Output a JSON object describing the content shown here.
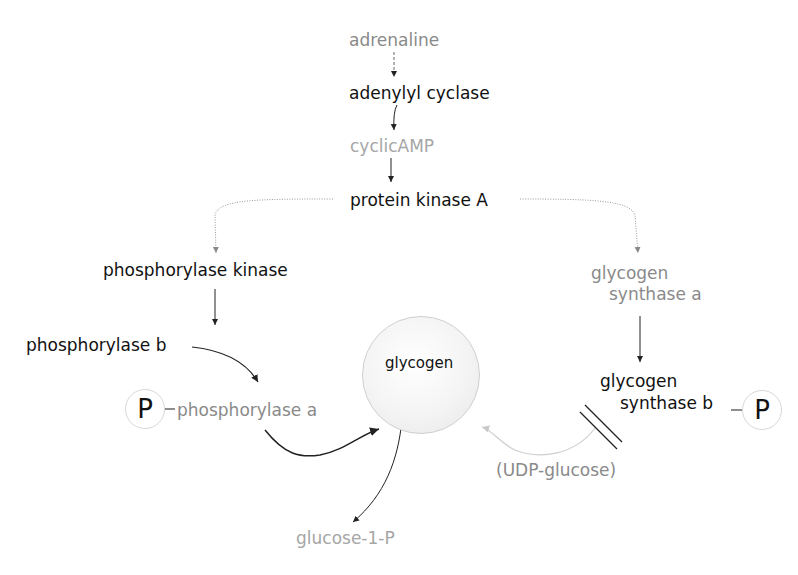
{
  "diagram": {
    "nodes": {
      "adrenaline": "adrenaline",
      "adenylyl_cyclase": "adenylyl cyclase",
      "cyclic_amp": "cyclicAMP",
      "protein_kinase_a": "protein kinase A",
      "phosphorylase_kinase": "phosphorylase kinase",
      "phosphorylase_b": "phosphorylase b",
      "phosphorylase_a": "phosphorylase a",
      "glycogen": "glycogen",
      "glycogen_synthase_a_line1": "glycogen",
      "glycogen_synthase_a_line2": "synthase a",
      "glycogen_synthase_b_line1": "glycogen",
      "glycogen_synthase_b_line2": "synthase b",
      "udp_glucose": "(UDP-glucose)",
      "glucose_1_p": "glucose-1-P",
      "phosphate_left": "P",
      "phosphate_right": "P"
    },
    "colors": {
      "dark_text": "#111111",
      "grey_text": "#8a8a8a",
      "light_text": "#a6a6a6",
      "arrow": "#222222",
      "dotted_arrow": "#999999",
      "faded_arrow": "#cccccc"
    }
  }
}
